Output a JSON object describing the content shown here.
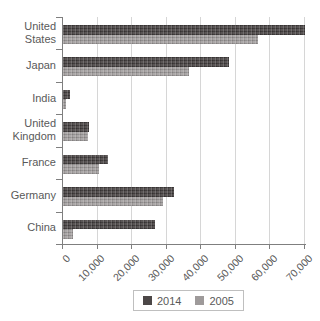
{
  "chart_data": {
    "type": "bar",
    "orientation": "horizontal",
    "title": "",
    "xlabel": "",
    "ylabel": "",
    "categories": [
      "United States",
      "Japan",
      "India",
      "United Kingdom",
      "France",
      "Germany",
      "China"
    ],
    "series": [
      {
        "name": "2014",
        "color": "#4c4747",
        "values": [
          70000,
          48000,
          2000,
          7500,
          13000,
          32000,
          26500
        ]
      },
      {
        "name": "2005",
        "color": "#9e9a9a",
        "values": [
          56500,
          36500,
          1000,
          7200,
          10500,
          29000,
          3000
        ]
      }
    ],
    "xlim": [
      0,
      70000
    ],
    "x_tick_values": [
      0,
      10000,
      20000,
      30000,
      40000,
      50000,
      60000,
      70000
    ],
    "x_tick_labels": [
      "0",
      "10,000",
      "20,000",
      "30,000",
      "40,000",
      "50,000",
      "60,000",
      "70,000"
    ],
    "grid": "vertical-gridlines",
    "legend_position": "bottom-center"
  },
  "legend": {
    "items": [
      {
        "label": "2014"
      },
      {
        "label": "2005"
      }
    ]
  }
}
